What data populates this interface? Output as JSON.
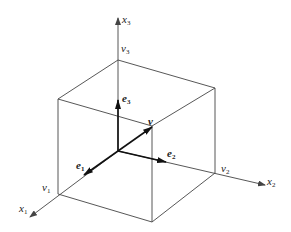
{
  "diagram": {
    "type": "3d-cube-coordinate-system",
    "axes": [
      {
        "id": "x1",
        "label": "x",
        "sub": "1"
      },
      {
        "id": "x2",
        "label": "x",
        "sub": "2"
      },
      {
        "id": "x3",
        "label": "x",
        "sub": "3"
      }
    ],
    "components": [
      {
        "id": "v1",
        "label": "v",
        "sub": "1"
      },
      {
        "id": "v2",
        "label": "v",
        "sub": "2"
      },
      {
        "id": "v3",
        "label": "v",
        "sub": "3"
      }
    ],
    "basis_vectors": [
      {
        "id": "e1",
        "label": "e",
        "sub": "1"
      },
      {
        "id": "e2",
        "label": "e",
        "sub": "2"
      },
      {
        "id": "e3",
        "label": "e",
        "sub": "3"
      }
    ],
    "vector": {
      "id": "v",
      "label": "v"
    },
    "colors": {
      "line": "#444444",
      "vector": "#111111",
      "background": "#ffffff"
    }
  }
}
